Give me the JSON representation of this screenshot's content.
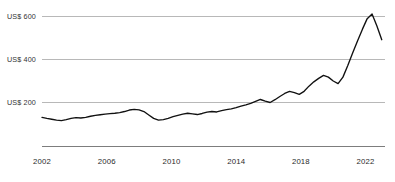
{
  "chart_data": {
    "type": "line",
    "title": "",
    "subtitle": "",
    "xlabel": "",
    "ylabel": "",
    "grid": true,
    "legend": "none",
    "xlim": [
      2002,
      2023.2
    ],
    "ylim": [
      0,
      680
    ],
    "y_ticks": [
      200,
      400,
      600
    ],
    "y_tick_labels": [
      "US$ 200",
      "US$ 400",
      "US$ 600"
    ],
    "x_ticks": [
      2002,
      2006,
      2010,
      2014,
      2018,
      2022
    ],
    "x_tick_labels": [
      "2002",
      "2006",
      "2010",
      "2014",
      "2018",
      "2022"
    ],
    "series": [
      {
        "name": "Price",
        "color": "#111111",
        "x": [
          2002.0,
          2002.3,
          2002.6,
          2002.9,
          2003.2,
          2003.5,
          2003.8,
          2004.1,
          2004.4,
          2004.7,
          2005.0,
          2005.3,
          2005.6,
          2005.9,
          2006.2,
          2006.5,
          2006.8,
          2007.1,
          2007.4,
          2007.7,
          2008.0,
          2008.3,
          2008.6,
          2008.9,
          2009.2,
          2009.5,
          2009.8,
          2010.1,
          2010.4,
          2010.7,
          2011.0,
          2011.3,
          2011.6,
          2011.9,
          2012.2,
          2012.5,
          2012.8,
          2013.1,
          2013.4,
          2013.7,
          2014.0,
          2014.3,
          2014.6,
          2014.9,
          2015.2,
          2015.5,
          2015.8,
          2016.1,
          2016.4,
          2016.7,
          2017.0,
          2017.3,
          2017.6,
          2017.9,
          2018.2,
          2018.5,
          2018.8,
          2019.1,
          2019.4,
          2019.7,
          2020.0,
          2020.3,
          2020.6,
          2020.9,
          2021.2,
          2021.5,
          2021.8,
          2022.1,
          2022.4,
          2022.7,
          2023.0
        ],
        "y": [
          131,
          126,
          122,
          118,
          116,
          120,
          126,
          130,
          128,
          131,
          136,
          140,
          143,
          146,
          148,
          150,
          153,
          158,
          165,
          168,
          166,
          158,
          142,
          126,
          118,
          120,
          126,
          134,
          140,
          146,
          150,
          147,
          144,
          149,
          155,
          158,
          156,
          162,
          167,
          170,
          176,
          183,
          189,
          196,
          205,
          214,
          206,
          200,
          213,
          228,
          242,
          252,
          246,
          238,
          252,
          276,
          296,
          312,
          326,
          318,
          300,
          288,
          318,
          372,
          430,
          486,
          540,
          590,
          612,
          556,
          492
        ]
      }
    ],
    "notes": {
      "start_value": 131,
      "peak_value": 612,
      "peak_year": 2022.7,
      "end_value": 492,
      "trough_value": 116,
      "trough_year": 2003.2
    }
  },
  "axes": {
    "y_axis_name": "value-axis",
    "x_axis_name": "year-axis"
  }
}
